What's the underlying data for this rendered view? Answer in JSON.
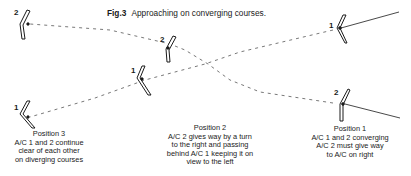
{
  "figure": {
    "label": "Fig.3",
    "title": "Approaching on converging courses."
  },
  "aircraft_labels": {
    "pos1_ac1": "1",
    "pos1_ac2": "2",
    "pos2_ac1": "1",
    "pos2_ac2": "2",
    "pos3_ac1": "1",
    "pos3_ac2": "2"
  },
  "captions": {
    "position1": {
      "heading": "Position 1",
      "line1": "A/C 1 and 2 converging",
      "line2": "A/C 2 must give way",
      "line3": "to A/C on right"
    },
    "position2": {
      "heading": "Position 2",
      "line1": "A/C 2 gives way by a turn",
      "line2": "to the right and passing",
      "line3": "behind A/C 1 keeping it on",
      "line4": "view to the left"
    },
    "position3": {
      "heading": "Position 3",
      "line1": "A/C 1 and 2 continue",
      "line2": "clear of each other",
      "line3": "on diverging courses"
    }
  },
  "colors": {
    "ink": "#1a1a1a",
    "path": "#555555",
    "background": "#ffffff"
  }
}
